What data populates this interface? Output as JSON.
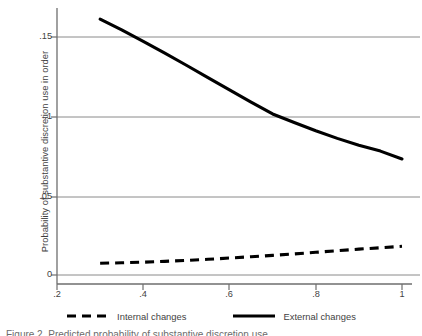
{
  "chart_data": {
    "type": "line",
    "title": "",
    "xlabel": "",
    "ylabel": "Probability of substantive discretion use in order",
    "xlim": [
      0.2,
      1.0
    ],
    "ylim": [
      0.0,
      0.1675
    ],
    "xticks": [
      0.2,
      0.4,
      0.6,
      0.8,
      1.0
    ],
    "xtick_labels": [
      ".2",
      ".4",
      ".6",
      ".8",
      "1"
    ],
    "yticks": [
      0.0,
      0.05,
      0.1,
      0.15
    ],
    "ytick_labels": [
      "0",
      ".05",
      ".1",
      ".15"
    ],
    "grid": "horizontal",
    "legend_position": "bottom",
    "series": [
      {
        "name": "Internal changes",
        "style": "dashed",
        "color": "#000000",
        "x": [
          0.3,
          0.35,
          0.4,
          0.45,
          0.5,
          0.55,
          0.6,
          0.65,
          0.7,
          0.75,
          0.8,
          0.85,
          0.9,
          0.95,
          1.0
        ],
        "values": [
          0.0074,
          0.0077,
          0.0081,
          0.0086,
          0.0092,
          0.0099,
          0.0107,
          0.0115,
          0.0124,
          0.0133,
          0.0143,
          0.0153,
          0.0163,
          0.0172,
          0.0181
        ]
      },
      {
        "name": "External changes",
        "style": "solid",
        "color": "#000000",
        "x": [
          0.3,
          0.35,
          0.4,
          0.45,
          0.5,
          0.55,
          0.6,
          0.65,
          0.7,
          0.75,
          0.8,
          0.85,
          0.9,
          0.95,
          1.0
        ],
        "values": [
          0.1613,
          0.1545,
          0.1473,
          0.1398,
          0.1322,
          0.1244,
          0.1167,
          0.109,
          0.1015,
          0.0961,
          0.0909,
          0.0861,
          0.0818,
          0.0781,
          0.0731
        ]
      }
    ]
  },
  "legend": {
    "entries": [
      {
        "label": "Internal changes",
        "key": "dashed-line-key"
      },
      {
        "label": "External changes",
        "key": "solid-line-key"
      }
    ]
  },
  "caption": {
    "text": "Figure 2.  Predicted probability of substantive discretion use"
  },
  "colors": {
    "axis": "#6e6e6e",
    "grid": "#8a8a8a",
    "line": "#000000",
    "text": "#3f3f3f"
  }
}
